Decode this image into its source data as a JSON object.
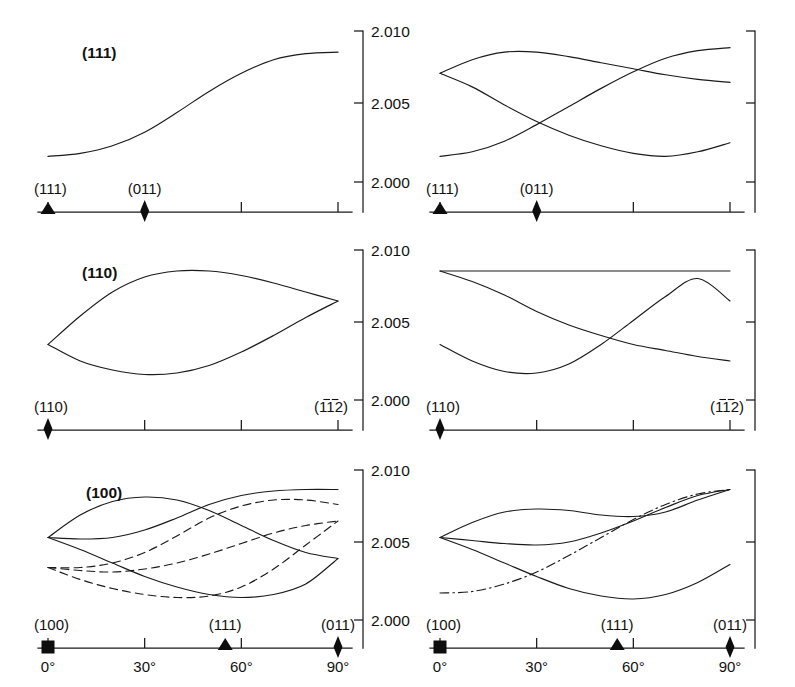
{
  "figure": {
    "kind": "g-factor-angular-dependence-panels",
    "rows": 3,
    "cols": 2,
    "background": "#ffffff",
    "ink_color": "#111111"
  },
  "axes": {
    "y_ticks": [
      "2.010",
      "2.005",
      "2.000"
    ],
    "y_values": [
      2.01,
      2.005,
      2.0
    ],
    "x_ticks_bottom": [
      "0°",
      "30°",
      "60°",
      "90°"
    ],
    "x_values_bottom": [
      0,
      30,
      60,
      90
    ]
  },
  "panels": [
    {
      "id": "row1-left",
      "title": "(111)",
      "y_label_left": "(111)",
      "y_label_mid": "(011)",
      "x_markers": [
        {
          "shape": "triangle",
          "angle": 0,
          "label": "(111)"
        },
        {
          "shape": "diamond",
          "angle": 30,
          "label": "(011)"
        }
      ],
      "x_tick_angles": [
        0,
        30,
        60,
        90
      ],
      "series_count": 1
    },
    {
      "id": "row1-right",
      "title": "",
      "x_markers": [
        {
          "shape": "triangle",
          "angle": 0,
          "label": "(111)"
        },
        {
          "shape": "diamond",
          "angle": 30,
          "label": "(011)"
        }
      ],
      "x_tick_angles": [
        0,
        30,
        60,
        90
      ],
      "series_count": 3
    },
    {
      "id": "row2-left",
      "title": "(110)",
      "x_markers": [
        {
          "shape": "diamond",
          "angle": 0,
          "label": "(110)"
        }
      ],
      "right_label": "(1̒1̒2)",
      "x_tick_angles": [
        0,
        30,
        60,
        90
      ],
      "series_count": 2
    },
    {
      "id": "row2-right",
      "title": "",
      "x_markers": [
        {
          "shape": "diamond",
          "angle": 0,
          "label": "(110)"
        }
      ],
      "right_label": "(1̒1̒2)",
      "x_tick_angles": [
        0,
        30,
        60,
        90
      ],
      "series_count": 3
    },
    {
      "id": "row3-left",
      "title": "(100)",
      "x_markers": [
        {
          "shape": "square",
          "angle": 0,
          "label": "(100)"
        },
        {
          "shape": "triangle",
          "angle": 55,
          "label": "(111)"
        },
        {
          "shape": "diamond",
          "angle": 90,
          "label": "(011)"
        }
      ],
      "x_tick_angles": [
        0,
        30,
        60,
        90
      ],
      "series_count": 6
    },
    {
      "id": "row3-right",
      "title": "",
      "x_markers": [
        {
          "shape": "square",
          "angle": 0,
          "label": "(100)"
        },
        {
          "shape": "triangle",
          "angle": 55,
          "label": "(111)"
        },
        {
          "shape": "diamond",
          "angle": 90,
          "label": "(011)"
        }
      ],
      "x_tick_angles": [
        0,
        30,
        60,
        90
      ],
      "series_count": 4
    }
  ],
  "labels": {
    "t111": "(111)",
    "t110": "(110)",
    "t100": "(100)",
    "d111": "(111)",
    "d011": "(011)",
    "d110": "(110)",
    "d100": "(100)",
    "d112bar": "(11̒2)",
    "y010": "2.010",
    "y005": "2.005",
    "y000": "2.000",
    "a0": "0°",
    "a30": "30°",
    "a60": "60°",
    "a90": "90°"
  },
  "chart_data": {
    "type": "line",
    "title": "",
    "xlabel": "",
    "ylabel": "g",
    "ylim": [
      1.9985,
      2.0105
    ],
    "yticks": [
      2.0,
      2.005,
      2.01
    ],
    "grid": false,
    "legend": "none",
    "panels": [
      {
        "name": "(111) plane - left",
        "x": [
          0,
          10,
          20,
          30,
          40,
          50,
          60,
          70,
          80,
          90
        ],
        "xlim": [
          0,
          90
        ],
        "series": [
          {
            "name": "g-branch-1",
            "style": "solid",
            "values": [
              2.0017,
              2.0019,
              2.0024,
              2.0033,
              2.0046,
              2.006,
              2.0072,
              2.0081,
              2.0085,
              2.0086
            ]
          }
        ]
      },
      {
        "name": "(111) plane - right",
        "x": [
          0,
          10,
          20,
          30,
          40,
          50,
          60,
          70,
          80,
          90
        ],
        "xlim": [
          0,
          90
        ],
        "series": [
          {
            "name": "g-branch-1",
            "style": "solid",
            "values": [
              2.0072,
              2.0081,
              2.0086,
              2.0086,
              2.0083,
              2.0079,
              2.0075,
              2.0071,
              2.0068,
              2.0066
            ]
          },
          {
            "name": "g-branch-2",
            "style": "solid",
            "values": [
              2.0072,
              2.0063,
              2.0051,
              2.004,
              2.0031,
              2.0024,
              2.0019,
              2.0017,
              2.002,
              2.0026
            ]
          },
          {
            "name": "g-branch-3",
            "style": "solid",
            "values": [
              2.0017,
              2.002,
              2.0027,
              2.0038,
              2.005,
              2.0062,
              2.0073,
              2.0082,
              2.0087,
              2.0089
            ]
          }
        ]
      },
      {
        "name": "(110) plane - left",
        "x": [
          0,
          10,
          20,
          30,
          40,
          50,
          60,
          70,
          80,
          90
        ],
        "xlim": [
          0,
          90
        ],
        "series": [
          {
            "name": "g-upper-loop",
            "style": "solid",
            "values": [
              2.0037,
              2.0056,
              2.0072,
              2.0082,
              2.0086,
              2.0086,
              2.0083,
              2.0078,
              2.0072,
              2.0066
            ]
          },
          {
            "name": "g-lower-loop",
            "style": "solid",
            "values": [
              2.0037,
              2.0026,
              2.002,
              2.0017,
              2.0018,
              2.0023,
              2.0032,
              2.0043,
              2.0055,
              2.0066
            ]
          }
        ]
      },
      {
        "name": "(110) plane - right",
        "x": [
          0,
          10,
          20,
          30,
          40,
          50,
          60,
          70,
          80,
          90
        ],
        "xlim": [
          0,
          90
        ],
        "series": [
          {
            "name": "g-flat",
            "style": "solid",
            "values": [
              2.0086,
              2.0086,
              2.0086,
              2.0086,
              2.0086,
              2.0086,
              2.0086,
              2.0086,
              2.0086,
              2.0086
            ]
          },
          {
            "name": "g-descending",
            "style": "solid",
            "values": [
              2.0086,
              2.0079,
              2.007,
              2.0059,
              2.005,
              2.0043,
              2.0037,
              2.0033,
              2.0029,
              2.0026
            ]
          },
          {
            "name": "g-ascending",
            "style": "solid",
            "values": [
              2.0037,
              2.0026,
              2.0019,
              2.0018,
              2.0024,
              2.0037,
              2.0053,
              2.0069,
              2.0081,
              2.0066
            ]
          }
        ]
      },
      {
        "name": "(100) plane - left",
        "x": [
          0,
          10,
          20,
          30,
          40,
          50,
          60,
          70,
          80,
          90
        ],
        "xlim": [
          0,
          90
        ],
        "series": [
          {
            "name": "g-solid-1",
            "style": "solid",
            "values": [
              2.0055,
              2.007,
              2.0079,
              2.0082,
              2.008,
              2.0073,
              2.0063,
              2.0053,
              2.0045,
              2.0041
            ]
          },
          {
            "name": "g-solid-2",
            "style": "solid",
            "values": [
              2.0055,
              2.0054,
              2.0055,
              2.006,
              2.0068,
              2.0077,
              2.0083,
              2.0086,
              2.0087,
              2.0087
            ]
          },
          {
            "name": "g-solid-3",
            "style": "solid",
            "values": [
              2.0055,
              2.0047,
              2.0038,
              2.0029,
              2.0022,
              2.0017,
              2.0015,
              2.0017,
              2.0024,
              2.0041
            ]
          },
          {
            "name": "g-dashed-1",
            "style": "dashed",
            "values": [
              2.0035,
              2.0035,
              2.0038,
              2.0045,
              2.0056,
              2.0068,
              2.0076,
              2.008,
              2.008,
              2.0077
            ]
          },
          {
            "name": "g-dashed-2",
            "style": "dashed",
            "values": [
              2.0035,
              2.0033,
              2.0032,
              2.0034,
              2.0038,
              2.0044,
              2.0051,
              2.0058,
              2.0063,
              2.0066
            ]
          },
          {
            "name": "g-dashed-3",
            "style": "dashed",
            "values": [
              2.0035,
              2.0027,
              2.0021,
              2.0017,
              2.0015,
              2.0016,
              2.0022,
              2.0034,
              2.005,
              2.0066
            ]
          }
        ]
      },
      {
        "name": "(100) plane - right",
        "x": [
          0,
          10,
          20,
          30,
          40,
          50,
          60,
          70,
          80,
          90
        ],
        "xlim": [
          0,
          90
        ],
        "series": [
          {
            "name": "g-solid-1",
            "style": "solid",
            "values": [
              2.0055,
              2.0065,
              2.0072,
              2.0074,
              2.0073,
              2.007,
              2.0069,
              2.0072,
              2.008,
              2.0087
            ]
          },
          {
            "name": "g-solid-2",
            "style": "solid",
            "values": [
              2.0055,
              2.0053,
              2.0051,
              2.005,
              2.0052,
              2.0058,
              2.0066,
              2.0075,
              2.0083,
              2.0087
            ]
          },
          {
            "name": "g-solid-3",
            "style": "solid",
            "values": [
              2.0055,
              2.0047,
              2.0038,
              2.0029,
              2.0021,
              2.0016,
              2.0014,
              2.0017,
              2.0025,
              2.0037
            ]
          },
          {
            "name": "g-dashdot",
            "style": "dashdot",
            "values": [
              2.0018,
              2.0019,
              2.0024,
              2.0032,
              2.0043,
              2.0055,
              2.0067,
              2.0077,
              2.0084,
              2.0087
            ]
          }
        ]
      }
    ]
  }
}
